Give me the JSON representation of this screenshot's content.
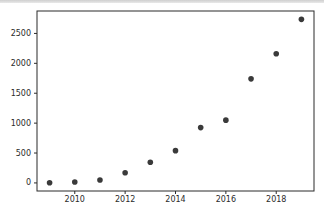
{
  "chart_data": {
    "type": "scatter",
    "title": "",
    "xlabel": "",
    "ylabel": "",
    "x": [
      2009,
      2010,
      2011,
      2012,
      2013,
      2014,
      2015,
      2016,
      2017,
      2018,
      2019
    ],
    "values": [
      2,
      15,
      50,
      170,
      345,
      540,
      925,
      1050,
      1740,
      2160,
      2735
    ],
    "xticks": [
      2010,
      2012,
      2014,
      2016,
      2018
    ],
    "yticks": [
      0,
      500,
      1000,
      1500,
      2000,
      2500
    ],
    "xlim": [
      2008.5,
      2019.5
    ],
    "ylim": [
      -135,
      2875
    ],
    "grid": false,
    "legend_position": "none",
    "marker_color": "#3a3a3a",
    "axis_color": "#2b2b2b",
    "tick_label_color": "#2b2b2b",
    "plot_background": "#ffffff"
  }
}
